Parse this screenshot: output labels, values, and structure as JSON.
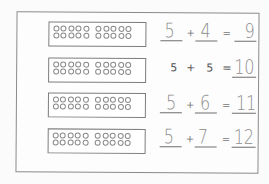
{
  "worksheet": {
    "rows": [
      {
        "frame": {
          "top": 5,
          "full_rows": 2,
          "circles_per_row": 10
        },
        "a": "5",
        "op": "+",
        "b": "4",
        "eq": "=",
        "result": "9",
        "a_handwritten": true,
        "b_handwritten": true,
        "top": 5
      },
      {
        "frame": {
          "top": 40,
          "full_rows": 2,
          "circles_per_row": 10
        },
        "a": "5",
        "op": "+",
        "b": "5",
        "eq": "=",
        "result": "10",
        "a_handwritten": false,
        "b_handwritten": false,
        "top": 40
      },
      {
        "frame": {
          "top": 75,
          "full_rows": 2,
          "circles_per_row": 10
        },
        "a": "5",
        "op": "+",
        "b": "6",
        "eq": "=",
        "result": "11",
        "a_handwritten": true,
        "b_handwritten": true,
        "top": 75
      },
      {
        "frame": {
          "top": 110,
          "full_rows": 2,
          "circles_per_row": 10
        },
        "a": "5",
        "op": "+",
        "b": "7",
        "eq": "=",
        "result": "12",
        "a_handwritten": true,
        "b_handwritten": true,
        "top": 110
      }
    ]
  },
  "colors": {
    "ink": "#8c8c8c",
    "border": "#7d7d7d",
    "paper": "#fdfdfd"
  }
}
